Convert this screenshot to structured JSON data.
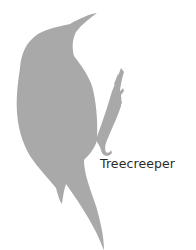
{
  "caption": "Treecreeper",
  "colors": {
    "silhouette": "#a9a9a9",
    "text": "#2b2b2b",
    "background": "#ffffff"
  }
}
